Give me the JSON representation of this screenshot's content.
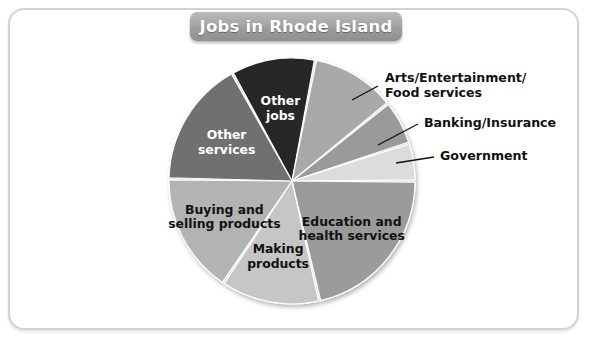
{
  "figure": {
    "title": "Jobs in Rhode Island",
    "frame_color": "#d2d2d2",
    "background": "#ffffff",
    "banner_color": "#a6a6a6",
    "banner_text_color": "#ffffff"
  },
  "chart_data": {
    "type": "pie",
    "title": "Jobs in Rhode Island",
    "xlabel": "",
    "ylabel": "",
    "legend_position": "none",
    "grid": false,
    "center": {
      "x": 292,
      "y": 181
    },
    "radius": 123,
    "categories": [
      "Other jobs",
      "Arts/Entertainment/Food services",
      "Banking/Insurance",
      "Government",
      "Education and health services",
      "Making products",
      "Buying and selling products",
      "Other services"
    ],
    "values": [
      11,
      11,
      6,
      5,
      21,
      13,
      16,
      17
    ],
    "slices": [
      {
        "name": "Other jobs",
        "value": 11,
        "color": "#272727",
        "start_angle": -29,
        "end_angle": 11,
        "label": "Other jobs",
        "label_lines": [
          "Other",
          "jobs"
        ],
        "label_placement": "inside",
        "label_color": "#ffffff"
      },
      {
        "name": "Arts/Entertainment/Food services",
        "value": 11,
        "color": "#a9a9a9",
        "start_angle": 11,
        "end_angle": 51,
        "label": "Arts/Entertainment/ Food services",
        "label_lines": [
          "Arts/Entertainment/",
          "Food services"
        ],
        "label_placement": "callout",
        "label_color": "#111111"
      },
      {
        "name": "Banking/Insurance",
        "value": 6,
        "color": "#9a9a9a",
        "start_angle": 51,
        "end_angle": 72,
        "label": "Banking/Insurance",
        "label_lines": [
          "Banking/Insurance"
        ],
        "label_placement": "callout",
        "label_color": "#111111"
      },
      {
        "name": "Government",
        "value": 5,
        "color": "#dcdcdc",
        "start_angle": 72,
        "end_angle": 90,
        "label": "Government",
        "label_lines": [
          "Government"
        ],
        "label_placement": "callout",
        "label_color": "#111111"
      },
      {
        "name": "Education and health services",
        "value": 21,
        "color": "#9b9b9b",
        "start_angle": 90,
        "end_angle": 167,
        "label": "Education and health services",
        "label_lines": [
          "Education and",
          "health services"
        ],
        "label_placement": "inside",
        "label_color": "#111111"
      },
      {
        "name": "Making products",
        "value": 13,
        "color": "#c6c6c6",
        "start_angle": 167,
        "end_angle": 214,
        "label": "Making products",
        "label_lines": [
          "Making",
          "products"
        ],
        "label_placement": "inside",
        "label_color": "#111111"
      },
      {
        "name": "Buying and selling products",
        "value": 16,
        "color": "#b3b3b3",
        "start_angle": 214,
        "end_angle": 271,
        "label": "Buying and selling products",
        "label_lines": [
          "Buying and",
          "selling products"
        ],
        "label_placement": "inside",
        "label_color": "#111111"
      },
      {
        "name": "Other services",
        "value": 17,
        "color": "#6f6f6f",
        "start_angle": 271,
        "end_angle": 331,
        "label": "Other services",
        "label_lines": [
          "Other",
          "services"
        ],
        "label_placement": "inside",
        "label_color": "#ffffff"
      }
    ],
    "callouts": [
      {
        "name": "Arts/Entertainment/Food services",
        "lines": [
          "Arts/Entertainment/",
          "Food services"
        ],
        "text_x": 385,
        "text_y": 82,
        "leader": {
          "x1": 352,
          "y1": 100,
          "x2": 378,
          "y2": 86
        }
      },
      {
        "name": "Banking/Insurance",
        "lines": [
          "Banking/Insurance"
        ],
        "text_x": 424,
        "text_y": 127,
        "leader": {
          "x1": 378,
          "y1": 145,
          "x2": 418,
          "y2": 124
        }
      },
      {
        "name": "Government",
        "lines": [
          "Government"
        ],
        "text_x": 440,
        "text_y": 160,
        "leader": {
          "x1": 396,
          "y1": 163,
          "x2": 434,
          "y2": 157
        }
      }
    ]
  }
}
